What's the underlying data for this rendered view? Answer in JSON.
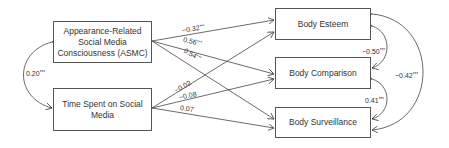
{
  "diagram": {
    "type": "path model",
    "predictors": [
      {
        "id": "asmc",
        "label": "Appearance-Related Social Media Consciousness (ASMC)"
      },
      {
        "id": "time",
        "label": "Time Spent on Social Media"
      }
    ],
    "outcomes": [
      {
        "id": "esteem",
        "label": "Body Esteem"
      },
      {
        "id": "comparison",
        "label": "Body Comparison"
      },
      {
        "id": "surveillance",
        "label": "Body Surveillance"
      }
    ],
    "paths": [
      {
        "from": "asmc",
        "to": "esteem",
        "coef": "−0.32",
        "sig": "***"
      },
      {
        "from": "asmc",
        "to": "comparison",
        "coef": "0.56",
        "sig": "***"
      },
      {
        "from": "asmc",
        "to": "surveillance",
        "coef": "0.54",
        "sig": "***"
      },
      {
        "from": "time",
        "to": "esteem",
        "coef": "−0.02",
        "sig": ""
      },
      {
        "from": "time",
        "to": "comparison",
        "coef": "−0.08",
        "sig": ""
      },
      {
        "from": "time",
        "to": "surveillance",
        "coef": "0.07",
        "sig": ""
      }
    ],
    "covariances": [
      {
        "between": [
          "asmc",
          "time"
        ],
        "coef": "0.20",
        "sig": "***"
      },
      {
        "between": [
          "esteem",
          "comparison"
        ],
        "coef": "−0.50",
        "sig": "***"
      },
      {
        "between": [
          "comparison",
          "surveillance"
        ],
        "coef": "0.41",
        "sig": "***"
      },
      {
        "between": [
          "esteem",
          "surveillance"
        ],
        "coef": "−0.42",
        "sig": "***"
      }
    ]
  },
  "colors": {
    "line": "#444444",
    "text": "#333333",
    "border": "#555555"
  }
}
